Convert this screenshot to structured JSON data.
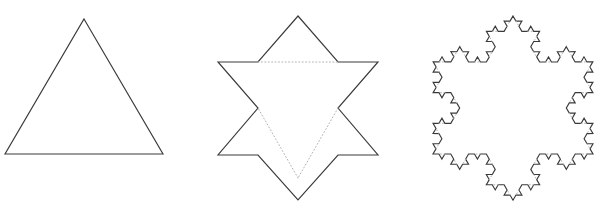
{
  "figure": {
    "background_color": "#ffffff",
    "stroke_color": "#3a3a3a",
    "dotted_color": "#b3b3b3",
    "width": 599,
    "height": 214
  },
  "chart_data": {
    "type": "diagram",
    "subtitle": "",
    "xlabel": "",
    "ylabel": "",
    "grid": false,
    "legend": "none",
    "annotations": [],
    "stages": [
      {
        "index": 0,
        "name": "stage-0-triangle",
        "label": "",
        "iteration": 0,
        "segments": 3,
        "center": [
          84,
          109
        ],
        "side_length": 158,
        "apex": [
          84,
          19
        ],
        "base_left": [
          5,
          154
        ],
        "base_right": [
          163,
          154
        ],
        "dotted_edges": 0,
        "solid_path": "M 84 19 L 163 154 L 5 154 Z",
        "dotted_path": ""
      },
      {
        "index": 1,
        "name": "stage-1-hexagram",
        "label": "",
        "iteration": 1,
        "segments": 12,
        "center": [
          298,
          108
        ],
        "outer_radius": 92,
        "outer_points": [
          [
            298,
            16
          ],
          [
            378,
            62
          ],
          [
            378,
            155
          ],
          [
            298,
            200
          ],
          [
            218,
            155
          ],
          [
            218,
            62
          ]
        ],
        "inner_points": [
          [
            338,
            62
          ],
          [
            378,
            108
          ],
          [
            338,
            155
          ],
          [
            258,
            155
          ],
          [
            218,
            108
          ],
          [
            258,
            62
          ]
        ],
        "dotted_edges": 3,
        "solid_path": "M 298 16 L 338 62 L 378 62 L 338 108 L 378 155 L 338 155 L 298 200 L 258 155 L 218 155 L 258 108 L 218 62 L 258 62 Z",
        "dotted_path": "M 258 62 L 338 62 M 338 108 L 298 178 M 298 178 L 258 108"
      },
      {
        "index": 2,
        "name": "stage-2-koch-snowflake",
        "label": "",
        "iteration": 3,
        "segments": 48,
        "center": [
          513,
          108
        ],
        "outer_radius": 92,
        "base_triangle": [
          [
            513,
            16
          ],
          [
            593,
            154
          ],
          [
            433,
            154
          ]
        ],
        "dotted_edges": 12,
        "note": "third-order Koch snowflake; dotted lines mark the bases of the newest bumps"
      }
    ]
  }
}
